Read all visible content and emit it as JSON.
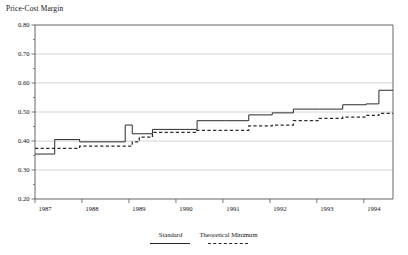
{
  "chart_data": {
    "type": "line",
    "title": "Price-Cost Margin",
    "xlabel": "",
    "ylabel": "",
    "ylim": [
      0.2,
      0.8
    ],
    "xlim": [
      1987.0,
      1994.62
    ],
    "grid": true,
    "grid_axis": "y",
    "legend_position": "bottom-center",
    "line_shape": "step",
    "y_ticks": [
      0.2,
      0.3,
      0.4,
      0.5,
      0.6,
      0.7,
      0.8
    ],
    "y_tick_labels": [
      "0.20",
      "0.30",
      "0.40",
      "0.50",
      "0.60",
      "0.70",
      "0.80"
    ],
    "y_minor_ticks": [
      0.25,
      0.35,
      0.45,
      0.55,
      0.65,
      0.75
    ],
    "x_ticks": [
      1987,
      1988,
      1989,
      1990,
      1991,
      1992,
      1993,
      1994
    ],
    "x_tick_labels": [
      "1987",
      "1988",
      "1989",
      "1990",
      "1991",
      "1992",
      "1993",
      "1994"
    ],
    "series": [
      {
        "name": "Standard",
        "style": "solid",
        "color": "#2b2b2b",
        "x": [
          1987.0,
          1987.42,
          1987.95,
          1988.92,
          1989.07,
          1989.22,
          1989.5,
          1990.08,
          1990.45,
          1991.05,
          1991.55,
          1992.05,
          1992.5,
          1993.05,
          1993.55,
          1994.05,
          1994.32,
          1994.62
        ],
        "values": [
          0.355,
          0.405,
          0.397,
          0.455,
          0.425,
          0.425,
          0.44,
          0.44,
          0.47,
          0.47,
          0.49,
          0.497,
          0.51,
          0.51,
          0.525,
          0.528,
          0.575,
          0.575
        ]
      },
      {
        "name": "Theoretical Minimum",
        "style": "dashed",
        "color": "#2b2b2b",
        "x": [
          1987.0,
          1987.42,
          1987.95,
          1988.92,
          1989.07,
          1989.22,
          1989.5,
          1990.08,
          1990.45,
          1991.05,
          1991.55,
          1992.05,
          1992.5,
          1993.05,
          1993.55,
          1994.05,
          1994.32,
          1994.62
        ],
        "values": [
          0.375,
          0.375,
          0.382,
          0.382,
          0.397,
          0.413,
          0.43,
          0.43,
          0.437,
          0.437,
          0.452,
          0.455,
          0.47,
          0.478,
          0.482,
          0.488,
          0.495,
          0.495
        ]
      }
    ]
  },
  "legend": {
    "entries": [
      {
        "label": "Standard",
        "style": "solid"
      },
      {
        "label": "Theoretical Minimum",
        "style": "dashed"
      }
    ]
  },
  "colors": {
    "line": "#2b2b2b",
    "grid": "#b7b7b7",
    "axis": "#555555",
    "text": "#111111",
    "background": "#ffffff"
  }
}
